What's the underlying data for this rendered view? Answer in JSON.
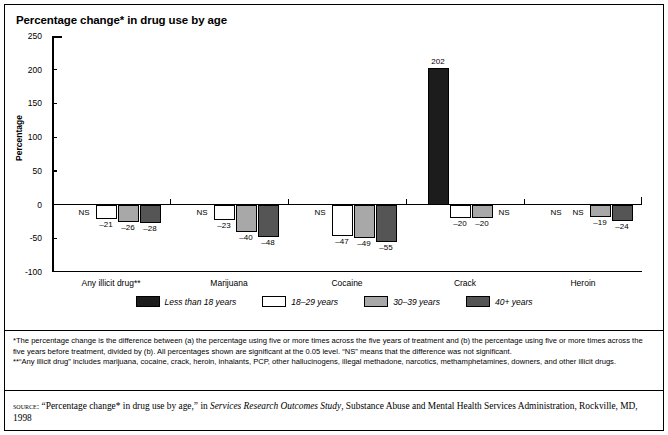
{
  "title": "Percentage change* in drug use by age",
  "chart_data": {
    "type": "bar",
    "title": "Percentage change* in drug use by age",
    "xlabel": "",
    "ylabel": "Percentage",
    "ylim": [
      -100,
      250
    ],
    "yticks": [
      250,
      200,
      150,
      100,
      50,
      0,
      -50,
      -100
    ],
    "grid": false,
    "legend_position": "bottom",
    "categories": [
      "Any illicit drug**",
      "Marijuana",
      "Cocaine",
      "Crack",
      "Heroin"
    ],
    "series": [
      {
        "name": "Less than 18 years",
        "color": "#1c1c1c",
        "values": [
          null,
          null,
          null,
          202,
          null
        ],
        "labels": [
          "NS",
          "NS",
          "NS",
          "202",
          "NS"
        ]
      },
      {
        "name": "18–29 years",
        "color": "#ffffff",
        "values": [
          -21,
          -23,
          -47,
          -20,
          null
        ],
        "labels": [
          "–21",
          "–23",
          "–47",
          "–20",
          "NS"
        ]
      },
      {
        "name": "30–39 years",
        "color": "#a8a8a8",
        "values": [
          -26,
          -40,
          -49,
          -20,
          -19
        ],
        "labels": [
          "–26",
          "–40",
          "–49",
          "–20",
          "–19"
        ]
      },
      {
        "name": "40+ years",
        "color": "#555555",
        "values": [
          -28,
          -48,
          -55,
          null,
          -24
        ],
        "labels": [
          "–28",
          "–48",
          "–55",
          "NS",
          "–24"
        ]
      }
    ]
  },
  "legend": [
    {
      "label": "Less than 18 years",
      "color": "#1c1c1c"
    },
    {
      "label": "18–29 years",
      "color": "#ffffff"
    },
    {
      "label": "30–39 years",
      "color": "#a8a8a8"
    },
    {
      "label": "40+ years",
      "color": "#555555"
    }
  ],
  "footnotes": {
    "line1": "*The percentage change is the difference between (a) the percentage using five or more times across the five years of treatment and (b) the percentage using five or more times across the five years before treatment, divided by (b). All percentages shown are significant at the 0.05 level. “NS” means that the difference was not significant.",
    "line2": "**“Any illicit drug” includes marijuana, cocaine, crack, heroin, inhalants, PCP, other hallucinogens, illegal methadone, narcotics, methamphetamines, downers, and other illicit drugs."
  },
  "source": {
    "label": "source:",
    "quote": "“Percentage change* in drug use by age,”",
    "in_word": "in",
    "study": "Services Research Outcomes Study",
    "publisher": ", Substance Abuse and Mental Health Services Administration, Rockville, MD, 1998"
  }
}
